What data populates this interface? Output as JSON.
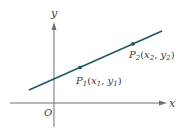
{
  "figure": {
    "axes": {
      "x_label": "x",
      "y_label": "y",
      "origin_label": "O",
      "axis_color": "#6b7378"
    },
    "line": {
      "color": "#1f5a63"
    },
    "points": [
      {
        "name": "P",
        "sub": "1",
        "coord_x": "x",
        "coord_x_sub": "1",
        "coord_y": "y",
        "coord_y_sub": "1"
      },
      {
        "name": "P",
        "sub": "2",
        "coord_x": "x",
        "coord_x_sub": "2",
        "coord_y": "y",
        "coord_y_sub": "2"
      }
    ]
  }
}
